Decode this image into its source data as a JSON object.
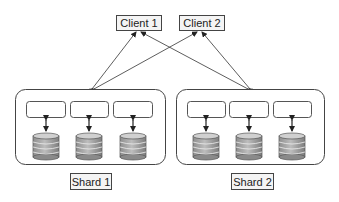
{
  "diagram": {
    "type": "sharded-database-architecture",
    "clients": [
      {
        "label": "Client 1"
      },
      {
        "label": "Client 2"
      }
    ],
    "shards": [
      {
        "label": "Shard 1",
        "nodes": 3,
        "databases": 3
      },
      {
        "label": "Shard 2",
        "nodes": 3,
        "databases": 3
      }
    ],
    "connections": [
      {
        "from": "Client 1",
        "to": "Shard 1",
        "bidirectional": true
      },
      {
        "from": "Client 1",
        "to": "Shard 2",
        "bidirectional": true
      },
      {
        "from": "Client 2",
        "to": "Shard 1",
        "bidirectional": true
      },
      {
        "from": "Client 2",
        "to": "Shard 2",
        "bidirectional": true
      }
    ],
    "colors": {
      "stroke": "#444444",
      "db_fill": "#a8a8a8",
      "db_top": "#c8c8c8",
      "background": "#ffffff"
    }
  }
}
